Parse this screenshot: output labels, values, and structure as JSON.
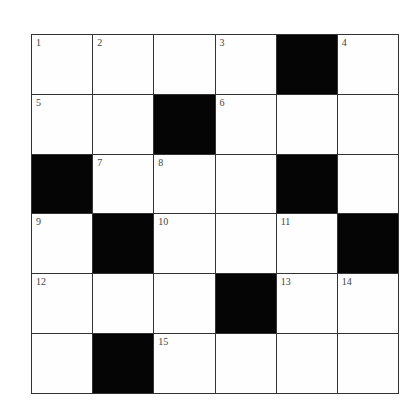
{
  "puzzle": {
    "rows": 6,
    "cols": 6,
    "colors": {
      "black": "#050505",
      "white": "#fefefe",
      "line": "#333333"
    },
    "cells": [
      [
        {
          "black": false,
          "num": "1"
        },
        {
          "black": false,
          "num": "2"
        },
        {
          "black": false,
          "num": ""
        },
        {
          "black": false,
          "num": "3"
        },
        {
          "black": true,
          "num": ""
        },
        {
          "black": false,
          "num": "4"
        }
      ],
      [
        {
          "black": false,
          "num": "5"
        },
        {
          "black": false,
          "num": ""
        },
        {
          "black": true,
          "num": ""
        },
        {
          "black": false,
          "num": "6"
        },
        {
          "black": false,
          "num": ""
        },
        {
          "black": false,
          "num": ""
        }
      ],
      [
        {
          "black": true,
          "num": ""
        },
        {
          "black": false,
          "num": "7"
        },
        {
          "black": false,
          "num": "8"
        },
        {
          "black": false,
          "num": ""
        },
        {
          "black": true,
          "num": ""
        },
        {
          "black": false,
          "num": ""
        }
      ],
      [
        {
          "black": false,
          "num": "9"
        },
        {
          "black": true,
          "num": ""
        },
        {
          "black": false,
          "num": "10"
        },
        {
          "black": false,
          "num": ""
        },
        {
          "black": false,
          "num": "11"
        },
        {
          "black": true,
          "num": ""
        }
      ],
      [
        {
          "black": false,
          "num": "12"
        },
        {
          "black": false,
          "num": ""
        },
        {
          "black": false,
          "num": ""
        },
        {
          "black": true,
          "num": ""
        },
        {
          "black": false,
          "num": "13"
        },
        {
          "black": false,
          "num": "14"
        }
      ],
      [
        {
          "black": false,
          "num": ""
        },
        {
          "black": true,
          "num": ""
        },
        {
          "black": false,
          "num": "15"
        },
        {
          "black": false,
          "num": ""
        },
        {
          "black": false,
          "num": ""
        },
        {
          "black": false,
          "num": ""
        }
      ]
    ]
  }
}
